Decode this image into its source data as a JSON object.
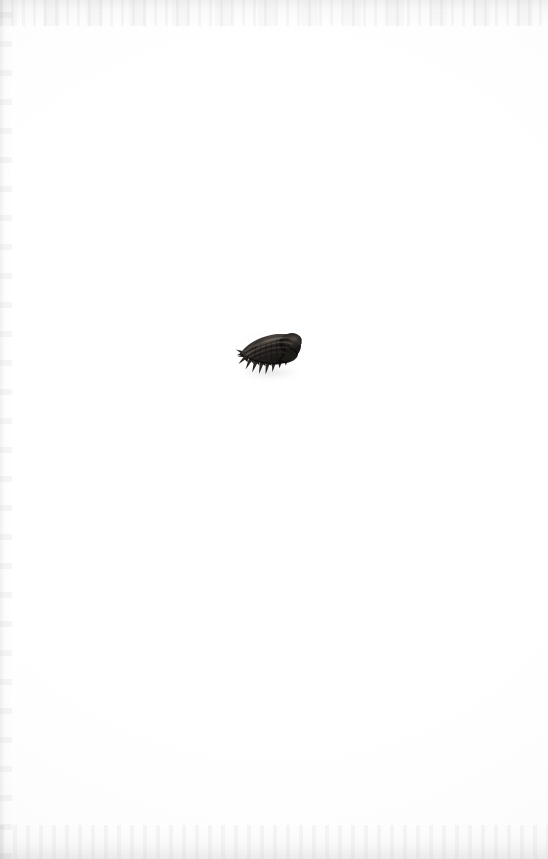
{
  "page": {
    "background_color": "#ffffff",
    "width": 548,
    "height": 859,
    "caption": "",
    "label": "",
    "page_number": ""
  },
  "specimen": {
    "name": "spiny-gastropod-shell",
    "description": "Dark spiny gastropod shell specimen, apertural view, spines directed to the lower left",
    "subject_type": "shell",
    "orientation": "apertural view, apex to the right",
    "spine_count": 6,
    "position": {
      "left": 232,
      "top": 326,
      "width": 76,
      "height": 58
    },
    "colors": {
      "body_dark": "#1c1a19",
      "body_mid": "#3b3734",
      "body_light": "#6a635d",
      "highlight": "#8d857c",
      "deep_shadow": "#0d0c0c",
      "shadow_cast": "#b4b4b8"
    }
  },
  "scan_artifacts": {
    "top_edge": "faint grey speckle band",
    "bottom_edge": "faint grey speckle band",
    "left_edge": "faint vertical grey line",
    "artifact_color": "#cdcdd0"
  }
}
